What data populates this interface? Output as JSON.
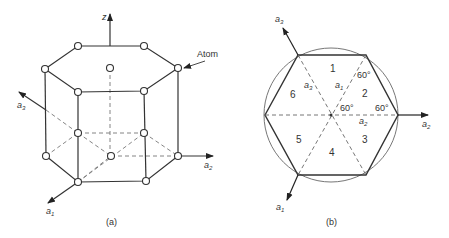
{
  "panel_a": {
    "caption": "(a)",
    "axes": {
      "z": "z",
      "a1": "a",
      "a1_sub": "1",
      "a2": "a",
      "a2_sub": "2",
      "a3": "a",
      "a3_sub": "3"
    },
    "atom_label": "Atom"
  },
  "panel_b": {
    "caption": "(b)",
    "axes": {
      "a1": "a",
      "a1_sub": "1",
      "a2": "a",
      "a2_sub": "2",
      "a3": "a",
      "a3_sub": "3"
    },
    "inner_axes": {
      "a1": "a",
      "a1_sub": "1",
      "a2": "a",
      "a2_sub": "2",
      "a3": "a",
      "a3_sub": "3"
    },
    "regions": [
      "1",
      "2",
      "3",
      "4",
      "5",
      "6"
    ],
    "angles": [
      "60°",
      "60°",
      "60°"
    ]
  },
  "colors": {
    "line": "#333333",
    "dashed": "#666666",
    "background": "#ffffff"
  }
}
